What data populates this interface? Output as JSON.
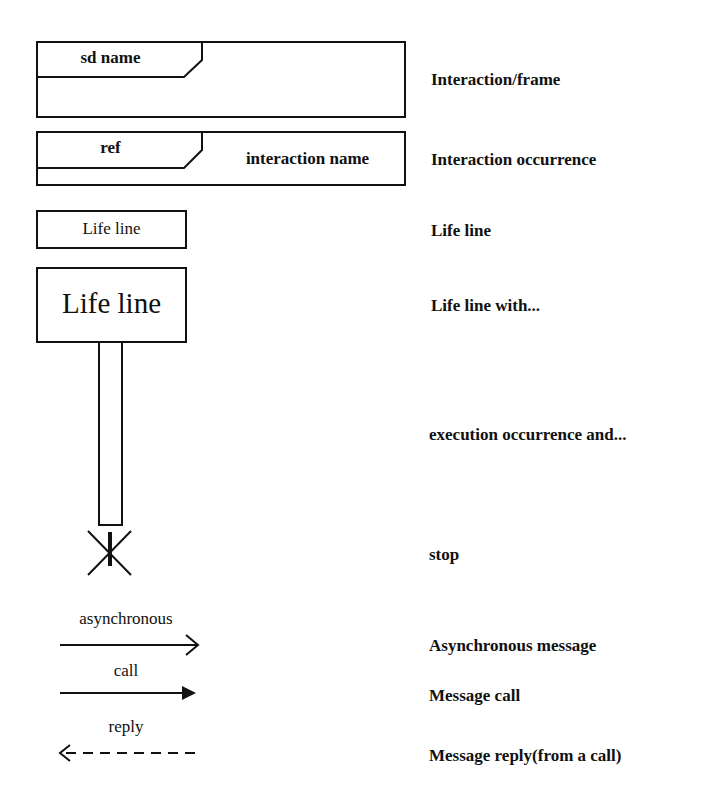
{
  "legend": [
    {
      "symbol": "frame",
      "symbol_text": "sd name",
      "label": "Interaction/frame"
    },
    {
      "symbol": "interaction-occurrence",
      "symbol_text": "ref",
      "symbol_subtext": "interaction name",
      "label": "Interaction occurrence"
    },
    {
      "symbol": "lifeline",
      "symbol_text": "Life line",
      "label": "Life line"
    },
    {
      "symbol": "lifeline-large",
      "symbol_text": "Life line",
      "label": "Life line with..."
    },
    {
      "symbol": "execution-occurrence",
      "label": "execution occurrence and..."
    },
    {
      "symbol": "stop",
      "label": "stop"
    },
    {
      "symbol": "async-message",
      "symbol_text": "asynchronous",
      "label": "Asynchronous message"
    },
    {
      "symbol": "message-call",
      "symbol_text": "call",
      "label": "Message call"
    },
    {
      "symbol": "message-reply",
      "symbol_text": "reply",
      "label": "Message reply(from a call)"
    }
  ],
  "colors": {
    "stroke": "#111111",
    "background": "#ffffff"
  }
}
